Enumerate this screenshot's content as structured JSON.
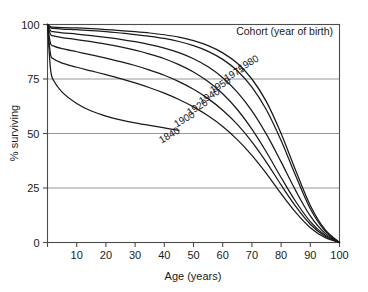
{
  "chart_data": {
    "type": "line",
    "title": "",
    "xlabel": "Age (years)",
    "ylabel": "% surviving",
    "xlim": [
      0,
      100
    ],
    "ylim": [
      0,
      100
    ],
    "xticks": [
      0,
      10,
      20,
      30,
      40,
      50,
      60,
      70,
      80,
      90,
      100
    ],
    "xticklabels": [
      "",
      "10",
      "20",
      "30",
      "40",
      "50",
      "60",
      "70",
      "80",
      "90",
      "100"
    ],
    "yticks": [
      0,
      25,
      50,
      75,
      100
    ],
    "yticklabels": [
      "0",
      "25",
      "50",
      "75",
      "100"
    ],
    "grid": "horizontal",
    "legend_position": "inside-top-right",
    "legend_title": "Cohort (year of birth)",
    "x": [
      0,
      1,
      2,
      5,
      10,
      15,
      20,
      25,
      30,
      35,
      40,
      45,
      50,
      55,
      60,
      65,
      70,
      75,
      80,
      85,
      90,
      95,
      100
    ],
    "series": [
      {
        "name": "1980",
        "label": "1980",
        "values": [
          100,
          99,
          98.8,
          98.6,
          98.4,
          98.1,
          97.7,
          97.2,
          96.7,
          96.1,
          95.3,
          94.2,
          92.6,
          90.3,
          87.0,
          82.2,
          75.0,
          64.5,
          50.0,
          33.0,
          17.0,
          6.0,
          0
        ]
      },
      {
        "name": "1975",
        "label": "1975",
        "values": [
          100,
          98.5,
          98.2,
          97.9,
          97.6,
          97.2,
          96.7,
          96.1,
          95.4,
          94.6,
          93.6,
          92.2,
          90.3,
          87.7,
          84.0,
          78.8,
          71.3,
          60.8,
          46.8,
          30.6,
          15.5,
          5.4,
          0
        ]
      },
      {
        "name": "1950",
        "label": "1950",
        "values": [
          100,
          97.2,
          96.7,
          96.2,
          95.6,
          94.9,
          94.1,
          93.2,
          92.1,
          90.8,
          89.2,
          87.1,
          84.3,
          80.6,
          75.6,
          69.0,
          60.4,
          49.6,
          37.0,
          23.8,
          12.2,
          4.3,
          0
        ]
      },
      {
        "name": "1940",
        "label": "1940",
        "values": [
          100,
          95.5,
          94.8,
          94.0,
          93.1,
          92.1,
          91.0,
          89.7,
          88.2,
          86.4,
          84.3,
          81.6,
          78.2,
          73.8,
          68.2,
          61.0,
          52.0,
          41.4,
          29.8,
          18.8,
          9.6,
          3.4,
          0
        ]
      },
      {
        "name": "1920",
        "label": "1920",
        "values": [
          100,
          91.5,
          90.2,
          88.9,
          87.5,
          86.1,
          84.6,
          83.0,
          81.2,
          79.1,
          76.7,
          73.8,
          70.3,
          66.0,
          60.7,
          54.2,
          46.2,
          36.8,
          26.4,
          16.6,
          8.4,
          2.9,
          0
        ]
      },
      {
        "name": "1900",
        "label": "1900",
        "values": [
          100,
          86.5,
          84.3,
          82.3,
          80.4,
          78.7,
          77.0,
          75.2,
          73.2,
          71.0,
          68.5,
          65.6,
          62.2,
          58.1,
          53.2,
          47.2,
          40.0,
          31.6,
          22.4,
          13.8,
          6.8,
          2.3,
          0
        ]
      },
      {
        "name": "1840",
        "label": "1840",
        "values": [
          100,
          80.0,
          74.5,
          69.0,
          63.8,
          60.3,
          58.0,
          56.3,
          54.9,
          53.7,
          52.6,
          51.4,
          null,
          null,
          null,
          null,
          null,
          null,
          null,
          null,
          null,
          null,
          null
        ]
      }
    ]
  },
  "legend": {
    "title": "Cohort (year of birth)"
  },
  "axes": {
    "x_title": "Age (years)",
    "y_title": "% surviving",
    "x_tick_labels": [
      "10",
      "20",
      "30",
      "40",
      "50",
      "60",
      "70",
      "80",
      "90",
      "100"
    ],
    "y_tick_labels": [
      "0",
      "25",
      "50",
      "75",
      "100"
    ]
  },
  "series_labels": [
    {
      "text": "1980",
      "x": 250,
      "y": 66,
      "rotate": -31
    },
    {
      "text": "1975",
      "x": 236,
      "y": 76,
      "rotate": -31
    },
    {
      "text": "1950",
      "x": 222,
      "y": 88,
      "rotate": -31
    },
    {
      "text": "1940",
      "x": 211,
      "y": 99,
      "rotate": -31
    },
    {
      "text": "1920",
      "x": 199,
      "y": 110,
      "rotate": -31
    },
    {
      "text": "1900",
      "x": 186,
      "y": 122,
      "rotate": -31
    },
    {
      "text": "1840",
      "x": 171,
      "y": 138,
      "rotate": -31
    }
  ],
  "colors": {
    "background": "#ffffff",
    "curve": "#1a1a1a",
    "gridline": "#8c8c8c",
    "frame": "#4d4d4d",
    "text": "#1a1a1a"
  }
}
